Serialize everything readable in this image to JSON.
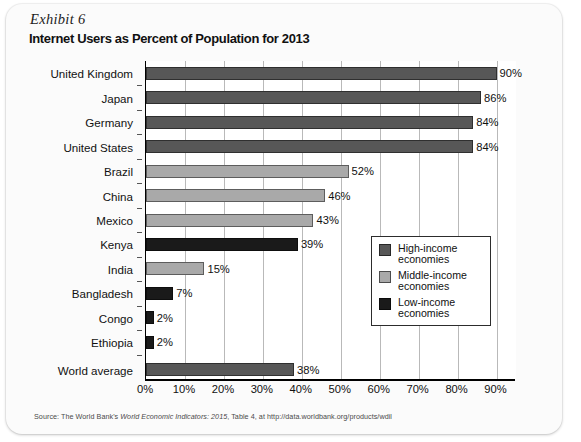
{
  "exhibit": {
    "label": "Exhibit 6",
    "title": "Internet Users as Percent of Population for 2013"
  },
  "source": {
    "prefix": "Source: The World Bank's ",
    "italic": "World Economic Indicators: 2015",
    "suffix": ", Table 4, at http://data.worldbank.org/products/wdil"
  },
  "legend": {
    "items": [
      {
        "label_line1": "High-income",
        "label_line2": "economies",
        "color": "#575757"
      },
      {
        "label_line1": "Middle-income",
        "label_line2": "economies",
        "color": "#a9a9a9"
      },
      {
        "label_line1": "Low-income",
        "label_line2": "economies",
        "color": "#1a1a1a"
      }
    ]
  },
  "colors": {
    "high_income": "#575757",
    "middle_income": "#a9a9a9",
    "low_income": "#1a1a1a",
    "world_average": "#575757",
    "gridline": "#b9b9b9",
    "axis": "#000000",
    "card_background": "#fbfbfb",
    "plot_background": "#ffffff"
  },
  "chart_data": {
    "type": "bar",
    "orientation": "horizontal",
    "title": "Internet Users as Percent of Population for 2013",
    "xlabel": "",
    "ylabel": "",
    "xlim": [
      0,
      95
    ],
    "xticks": [
      0,
      10,
      20,
      30,
      40,
      50,
      60,
      70,
      80,
      90
    ],
    "xtick_labels": [
      "0%",
      "10%",
      "20%",
      "30%",
      "40%",
      "50%",
      "60%",
      "70%",
      "80%",
      "90%"
    ],
    "grid": "vertical",
    "legend_position": "center-right",
    "categories": [
      "United Kingdom",
      "Japan",
      "Germany",
      "United States",
      "Brazil",
      "China",
      "Mexico",
      "Kenya",
      "India",
      "Bangladesh",
      "Congo",
      "Ethiopia",
      "World average"
    ],
    "values": [
      90,
      86,
      84,
      84,
      52,
      46,
      43,
      39,
      15,
      7,
      2,
      2,
      38
    ],
    "value_labels": [
      "90%",
      "86%",
      "84%",
      "84%",
      "52%",
      "46%",
      "43%",
      "39%",
      "15%",
      "7%",
      "2%",
      "2%",
      "38%"
    ],
    "groups": [
      "high_income",
      "high_income",
      "high_income",
      "high_income",
      "middle_income",
      "middle_income",
      "middle_income",
      "low_income",
      "middle_income",
      "low_income",
      "low_income",
      "low_income",
      "world_average"
    ],
    "series": [
      {
        "name": "High-income economies",
        "points": [
          {
            "category": "United Kingdom",
            "value": 90
          },
          {
            "category": "Japan",
            "value": 86
          },
          {
            "category": "Germany",
            "value": 84
          },
          {
            "category": "United States",
            "value": 84
          }
        ]
      },
      {
        "name": "Middle-income economies",
        "points": [
          {
            "category": "Brazil",
            "value": 52
          },
          {
            "category": "China",
            "value": 46
          },
          {
            "category": "Mexico",
            "value": 43
          },
          {
            "category": "India",
            "value": 15
          }
        ]
      },
      {
        "name": "Low-income economies",
        "points": [
          {
            "category": "Kenya",
            "value": 39
          },
          {
            "category": "Bangladesh",
            "value": 7
          },
          {
            "category": "Congo",
            "value": 2
          },
          {
            "category": "Ethiopia",
            "value": 2
          }
        ]
      },
      {
        "name": "World average",
        "points": [
          {
            "category": "World average",
            "value": 38
          }
        ]
      }
    ]
  }
}
